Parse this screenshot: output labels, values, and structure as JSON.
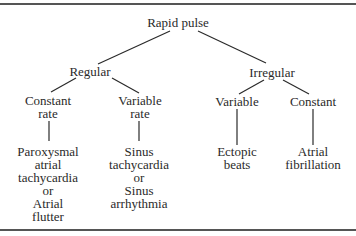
{
  "diagram": {
    "type": "decision-tree",
    "root": {
      "label": "Rapid pulse",
      "children": [
        {
          "label": "Regular",
          "children": [
            {
              "label_lines": [
                "Constant",
                "rate"
              ],
              "outcome_lines": [
                "Paroxysmal",
                "atrial",
                "tachycardia",
                "or",
                "Atrial",
                "flutter"
              ]
            },
            {
              "label_lines": [
                "Variable",
                "rate"
              ],
              "outcome_lines": [
                "Sinus",
                "tachycardia",
                "or",
                "Sinus",
                "arrhythmia"
              ]
            }
          ]
        },
        {
          "label": "Irregular",
          "children": [
            {
              "label_lines": [
                "Variable"
              ],
              "outcome_lines": [
                "Ectopic",
                "beats"
              ]
            },
            {
              "label_lines": [
                "Constant"
              ],
              "outcome_lines": [
                "Atrial",
                "fibrillation"
              ]
            }
          ]
        }
      ]
    }
  },
  "nodes": {
    "root": "Rapid pulse",
    "regular": "Regular",
    "irregular": "Irregular",
    "constant_rate_1": "Constant",
    "constant_rate_2": "rate",
    "variable_rate_1": "Variable",
    "variable_rate_2": "rate",
    "irr_variable": "Variable",
    "irr_constant": "Constant",
    "pat_1": "Paroxysmal",
    "pat_2": "atrial",
    "pat_3": "tachycardia",
    "pat_4": "or",
    "pat_5": "Atrial",
    "pat_6": "flutter",
    "sinus_1": "Sinus",
    "sinus_2": "tachycardia",
    "sinus_3": "or",
    "sinus_4": "Sinus",
    "sinus_5": "arrhythmia",
    "ectopic_1": "Ectopic",
    "ectopic_2": "beats",
    "af_1": "Atrial",
    "af_2": "fibrillation"
  },
  "colors": {
    "text": "#2a2a2a",
    "rule": "#555555",
    "background": "#ffffff"
  }
}
